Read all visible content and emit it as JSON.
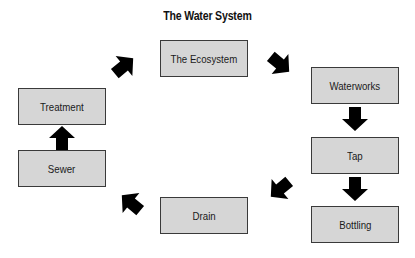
{
  "diagram": {
    "title": "The Water System",
    "node_fill": "#d6d6d6",
    "node_border": "#3a3a3a",
    "arrow_color": "#000000",
    "nodes": [
      {
        "id": "ecosystem",
        "label": "The Ecosystem"
      },
      {
        "id": "waterworks",
        "label": "Waterworks"
      },
      {
        "id": "tap",
        "label": "Tap"
      },
      {
        "id": "bottling",
        "label": "Bottling"
      },
      {
        "id": "drain",
        "label": "Drain"
      },
      {
        "id": "sewer",
        "label": "Sewer"
      },
      {
        "id": "treatment",
        "label": "Treatment"
      }
    ],
    "edges": [
      {
        "from": "ecosystem",
        "to": "waterworks",
        "direction": "down-right"
      },
      {
        "from": "waterworks",
        "to": "tap",
        "direction": "down"
      },
      {
        "from": "tap",
        "to": "bottling",
        "direction": "down"
      },
      {
        "from": "tap",
        "to": "drain",
        "direction": "down-left"
      },
      {
        "from": "drain",
        "to": "sewer",
        "direction": "up-left"
      },
      {
        "from": "sewer",
        "to": "treatment",
        "direction": "up"
      },
      {
        "from": "treatment",
        "to": "ecosystem",
        "direction": "up-right"
      }
    ]
  }
}
